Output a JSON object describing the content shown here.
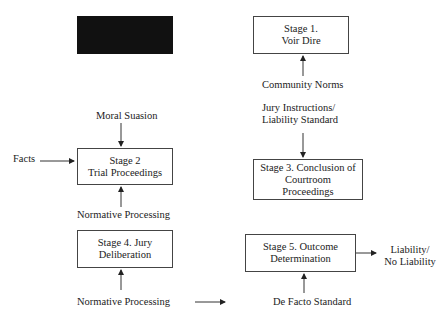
{
  "diagram": {
    "redacted_box": {
      "color": "#111111"
    },
    "stages": [
      {
        "id": "stage1",
        "label": "Stage 1.\nVoir Dire"
      },
      {
        "id": "stage2",
        "label": "Stage 2\nTrial Proceedings"
      },
      {
        "id": "stage3",
        "label": "Stage 3. Conclusion of\nCourtroom\nProceedings"
      },
      {
        "id": "stage4",
        "label": "Stage  4. Jury\nDeliberation"
      },
      {
        "id": "stage5",
        "label": "Stage 5. Outcome\nDetermination"
      }
    ],
    "labels": {
      "community_norms": "Community Norms",
      "jury_instructions": "Jury Instructions/\nLiability Standard",
      "moral_suasion": "Moral Suasion",
      "facts": "Facts",
      "normative_processing_1": "Normative Processing",
      "normative_processing_2": "Normative Processing",
      "de_facto_standard": "De Facto Standard",
      "outcome": "Liability/\nNo Liability"
    },
    "edges": [
      {
        "from": "community_norms",
        "to": "stage1"
      },
      {
        "from": "jury_instructions",
        "to": "stage3"
      },
      {
        "from": "moral_suasion",
        "to": "stage2"
      },
      {
        "from": "facts",
        "to": "stage2"
      },
      {
        "from": "normative_processing_1",
        "to": "stage2"
      },
      {
        "from": "normative_processing_2",
        "to": "stage4"
      },
      {
        "from": "normative_processing_2",
        "to": "stage5"
      },
      {
        "from": "de_facto_standard",
        "to": "stage5"
      },
      {
        "from": "stage5",
        "to": "outcome"
      }
    ]
  }
}
